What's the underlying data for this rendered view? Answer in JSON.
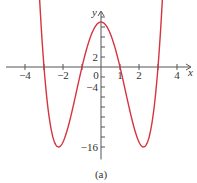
{
  "chart_data": {
    "type": "line",
    "title": "",
    "caption": "(a)",
    "xlabel": "x",
    "ylabel": "y",
    "function": "y = x^4 - 10x^2 + 9",
    "xlim": [
      -4.6,
      4.6
    ],
    "ylim": [
      -18,
      12
    ],
    "x_ticks": [
      -4,
      -3,
      -2,
      -1,
      1,
      2,
      3,
      4
    ],
    "x_tick_labels": [
      {
        "value": -4,
        "label": "−4"
      },
      {
        "value": -2,
        "label": "−2"
      },
      {
        "value": 0,
        "label": "0"
      },
      {
        "value": 1,
        "label": "1"
      },
      {
        "value": 2,
        "label": "2"
      },
      {
        "value": 4,
        "label": "4"
      }
    ],
    "y_ticks": [
      10,
      8,
      6,
      4,
      2,
      -2,
      -4,
      -6,
      -8,
      -10,
      -12,
      -14,
      -16
    ],
    "y_tick_labels": [
      {
        "value": 2,
        "label": "2"
      },
      {
        "value": -4,
        "label": "−4"
      },
      {
        "value": -16,
        "label": "−16"
      }
    ],
    "key_points": [
      {
        "x": -3,
        "y": 0
      },
      {
        "x": -2.236,
        "y": -16
      },
      {
        "x": -1,
        "y": 0
      },
      {
        "x": 0,
        "y": 9
      },
      {
        "x": 1,
        "y": 0
      },
      {
        "x": 2.236,
        "y": -16
      },
      {
        "x": 3,
        "y": 0
      }
    ],
    "curve_color": "#d6343f",
    "axis_color": "#555555",
    "grid": false,
    "legend": null
  }
}
